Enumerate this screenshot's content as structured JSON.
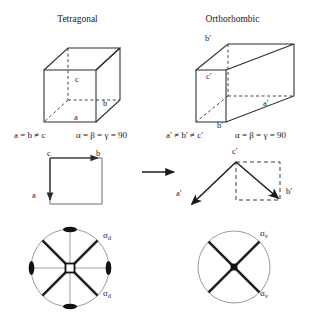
{
  "figure": {
    "kind": "crystal-system-transformation-diagram",
    "panels": [
      {
        "id": "tetragonal",
        "title": "Tetragonal",
        "cell_labels": {
          "a": "a",
          "b": "b",
          "c": "c"
        },
        "lattice_relation": "a = b ≠ c",
        "angle_relation": "α = β = γ = 90",
        "projection_labels": {
          "origin": "c",
          "right": "b",
          "down": "a"
        },
        "stereogram": {
          "mirror_label_top": "σ",
          "mirror_label_top_sub": "d",
          "mirror_label_bottom": "σ",
          "mirror_label_bottom_sub": "d",
          "principal_axis_symbol": "square-4-fold",
          "mirror_plane_count": 4,
          "pole_count": 4
        }
      },
      {
        "id": "orthorhombic",
        "title": "Orthorhombic",
        "cell_labels": {
          "a": "a′",
          "b": "b′",
          "c": "c′"
        },
        "lattice_relation": "a′ ≠ b′ ≠ c′",
        "angle_relation": "α = β = γ = 90",
        "projection_labels": {
          "origin": "c′",
          "left": "a′",
          "right": "b′"
        },
        "stereogram": {
          "mirror_label_top": "σ",
          "mirror_label_top_sub": "v",
          "mirror_label_bottom": "σ",
          "mirror_label_bottom_sub": "v",
          "principal_axis_symbol": "dot-2-fold",
          "mirror_plane_count": 2,
          "pole_count": 0
        }
      }
    ],
    "transform_arrow": "→",
    "colors": {
      "stroke": "#2b2b2b",
      "dashed": "#3a3a3a",
      "circle": "#9a9a9a",
      "thin_axis": "#8a8a8a",
      "text": "#1a1a1a",
      "fill_pole": "#111111"
    }
  }
}
